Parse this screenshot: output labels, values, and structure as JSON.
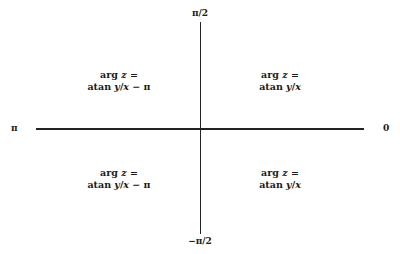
{
  "diagram": {
    "title": "",
    "axes": {
      "top_label": "π/2",
      "bottom_label": "−π/2",
      "left_label": "π",
      "right_label": "0"
    },
    "quadrants": {
      "upper_left": {
        "line1_pre": "arg ",
        "line1_var": "z",
        "line1_post": " =",
        "line2_pre": "atan ",
        "line2_var1": "y",
        "line2_slash": "/",
        "line2_var2": "x",
        "line2_post": " − π"
      },
      "upper_right": {
        "line1_pre": "arg ",
        "line1_var": "z",
        "line1_post": " =",
        "line2_pre": "atan ",
        "line2_var1": "y",
        "line2_slash": "/",
        "line2_var2": "x",
        "line2_post": ""
      },
      "lower_left": {
        "line1_pre": "arg ",
        "line1_var": "z",
        "line1_post": " =",
        "line2_pre": "atan ",
        "line2_var1": "y",
        "line2_slash": "/",
        "line2_var2": "x",
        "line2_post": " − π"
      },
      "lower_right": {
        "line1_pre": "arg ",
        "line1_var": "z",
        "line1_post": " =",
        "line2_pre": "atan ",
        "line2_var1": "y",
        "line2_slash": "/",
        "line2_var2": "x",
        "line2_post": ""
      }
    }
  }
}
